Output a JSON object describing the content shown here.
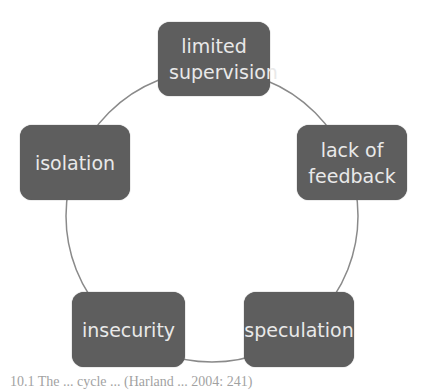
{
  "diagram": {
    "type": "cycle",
    "nodes": [
      {
        "label": "limited supervision"
      },
      {
        "label": "lack of feedback"
      },
      {
        "label": "speculation"
      },
      {
        "label": "insecurity"
      },
      {
        "label": "isolation"
      }
    ],
    "colors": {
      "node_fill": "#5e5e5e",
      "node_text": "#e9e9e9",
      "connector": "#8a8a8a"
    }
  },
  "caption": "10.1  The ...  cycle ... (Harland ... 2004: 241)"
}
